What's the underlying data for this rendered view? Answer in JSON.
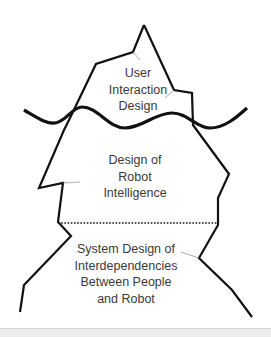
{
  "diagram": {
    "layers": [
      {
        "id": "top",
        "lines": [
          "User",
          "Interaction",
          "Design"
        ]
      },
      {
        "id": "middle",
        "lines": [
          "Design of",
          "Robot",
          "Intelligence"
        ]
      },
      {
        "id": "bottom",
        "lines": [
          "System Design of",
          "Interdependencies",
          "Between People",
          "and Robot"
        ]
      }
    ],
    "colors": {
      "outline": "#111111",
      "text": "#3a3a3a",
      "background": "#ffffff"
    }
  }
}
